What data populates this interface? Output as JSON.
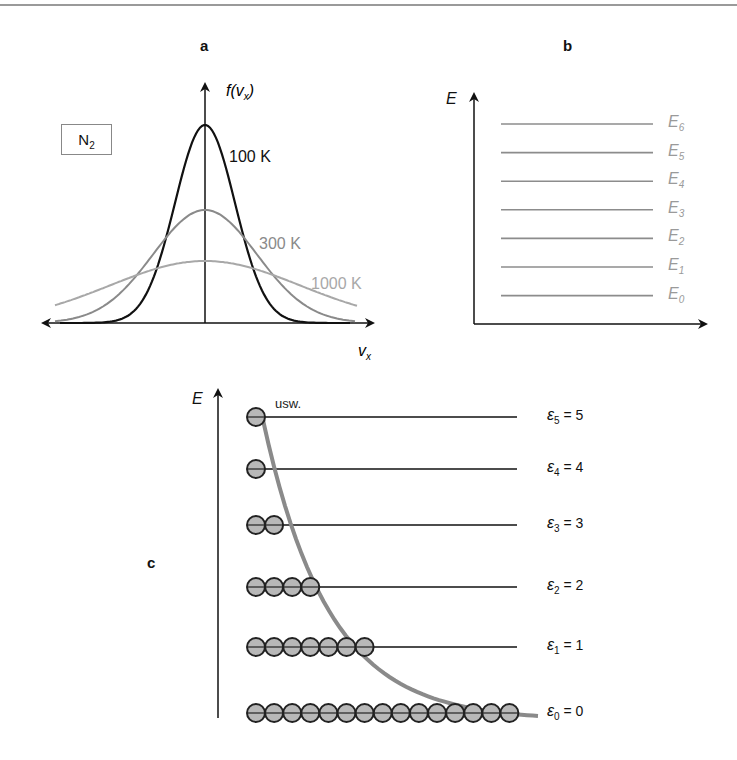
{
  "panels": {
    "a": {
      "letter": "a",
      "y_axis_label": "f(v",
      "y_axis_label_sub": "x",
      "y_axis_label_close": ")",
      "x_axis_label": "v",
      "x_axis_label_sub": "x",
      "species_box": {
        "text": "N",
        "sub": "2"
      },
      "curves": [
        {
          "label": "100 K",
          "color": "#111111",
          "peak_px": 125,
          "sigma_px": 30
        },
        {
          "label": "300 K",
          "color": "#8a8a8a",
          "peak_px": 210,
          "sigma_px": 52
        },
        {
          "label": "1000 K",
          "color": "#a8a8a8",
          "peak_px": 261,
          "sigma_px": 95
        }
      ]
    },
    "b": {
      "letter": "b",
      "y_axis_label": "E",
      "levels": [
        {
          "symbol": "E",
          "sub": "6"
        },
        {
          "symbol": "E",
          "sub": "5"
        },
        {
          "symbol": "E",
          "sub": "4"
        },
        {
          "symbol": "E",
          "sub": "3"
        },
        {
          "symbol": "E",
          "sub": "2"
        },
        {
          "symbol": "E",
          "sub": "1"
        },
        {
          "symbol": "E",
          "sub": "0"
        }
      ]
    },
    "c": {
      "letter": "c",
      "y_axis_label": "E",
      "etc_label": "usw.",
      "levels": [
        {
          "symbol": "ε",
          "sub": "5",
          "value": "= 5",
          "count": 1
        },
        {
          "symbol": "ε",
          "sub": "4",
          "value": "= 4",
          "count": 1
        },
        {
          "symbol": "ε",
          "sub": "3",
          "value": "= 3",
          "count": 2
        },
        {
          "symbol": "ε",
          "sub": "2",
          "value": "= 2",
          "count": 4
        },
        {
          "symbol": "ε",
          "sub": "1",
          "value": "= 1",
          "count": 7
        },
        {
          "symbol": "ε",
          "sub": "0",
          "value": "= 0",
          "count": 15
        }
      ]
    }
  },
  "colors": {
    "axis": "#111111",
    "level_line_b": "#8c8c8c",
    "level_label_b": "#9a9a9a",
    "particle_fill": "#b8b8b8",
    "particle_stroke": "#222222",
    "boltzmann_curve": "#8a8a8a"
  }
}
